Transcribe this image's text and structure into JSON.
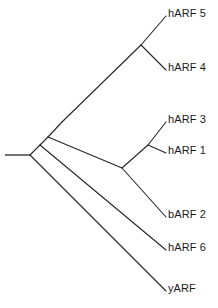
{
  "figure": {
    "type": "phylogenetic-tree",
    "orientation": "left-to-right",
    "style": "cladogram-slanted",
    "background_color": "#ffffff",
    "line_color": "#262626",
    "text_color": "#1a1a1a"
  },
  "tips": [
    {
      "id": "hARF5",
      "label": "hARF 5",
      "label_x": 168,
      "label_y": 8,
      "tip_x": 166,
      "tip_y": 16
    },
    {
      "id": "hARF4",
      "label": "hARF 4",
      "label_x": 168,
      "label_y": 62,
      "tip_x": 166,
      "tip_y": 70
    },
    {
      "id": "hARF3",
      "label": "hARF 3",
      "label_x": 168,
      "label_y": 114,
      "tip_x": 166,
      "tip_y": 122
    },
    {
      "id": "hARF1",
      "label": "hARF 1",
      "label_x": 168,
      "label_y": 145,
      "tip_x": 166,
      "tip_y": 153
    },
    {
      "id": "bARF2",
      "label": "bARF 2",
      "label_x": 168,
      "label_y": 209,
      "tip_x": 166,
      "tip_y": 217
    },
    {
      "id": "hARF6",
      "label": "hARF 6",
      "label_x": 168,
      "label_y": 242,
      "tip_x": 166,
      "tip_y": 250
    },
    {
      "id": "yARF",
      "label": "yARF",
      "label_x": 168,
      "label_y": 283,
      "tip_x": 166,
      "tip_y": 291
    }
  ],
  "nodes": [
    {
      "id": "root",
      "x": 30,
      "y": 155
    },
    {
      "id": "node-yarf",
      "x": 30,
      "y": 155
    },
    {
      "id": "node-harf6",
      "x": 40,
      "y": 145
    },
    {
      "id": "node-barf2",
      "x": 48,
      "y": 137
    },
    {
      "id": "node-upper",
      "x": 62,
      "y": 122
    },
    {
      "id": "node-54",
      "x": 141,
      "y": 45
    },
    {
      "id": "node-31",
      "x": 148,
      "y": 145
    },
    {
      "id": "node-131",
      "x": 122,
      "y": 168
    }
  ],
  "root_stub": {
    "x1": 5,
    "y1": 155,
    "x2": 30,
    "y2": 155
  },
  "branches": [
    {
      "name": "root-to-yarf",
      "x1": 30,
      "y1": 155,
      "x2": 166,
      "y2": 291
    },
    {
      "name": "root-to-node-harf6",
      "x1": 30,
      "y1": 155,
      "x2": 40,
      "y2": 145
    },
    {
      "name": "node-harf6-to-harf6",
      "x1": 40,
      "y1": 145,
      "x2": 166,
      "y2": 250
    },
    {
      "name": "node-harf6-to-barf2node",
      "x1": 40,
      "y1": 145,
      "x2": 48,
      "y2": 137
    },
    {
      "name": "node-barf2-to-crown",
      "x1": 48,
      "y1": 137,
      "x2": 122,
      "y2": 168
    },
    {
      "name": "node-barf2-to-upper",
      "x1": 48,
      "y1": 137,
      "x2": 62,
      "y2": 122
    },
    {
      "name": "crown-to-barf2",
      "x1": 122,
      "y1": 168,
      "x2": 166,
      "y2": 217
    },
    {
      "name": "crown-to-node31",
      "x1": 122,
      "y1": 168,
      "x2": 148,
      "y2": 145
    },
    {
      "name": "node31-to-harf3",
      "x1": 148,
      "y1": 145,
      "x2": 166,
      "y2": 122
    },
    {
      "name": "node31-to-harf1",
      "x1": 148,
      "y1": 145,
      "x2": 166,
      "y2": 153
    },
    {
      "name": "upper-to-node54",
      "x1": 62,
      "y1": 122,
      "x2": 141,
      "y2": 45
    },
    {
      "name": "node54-to-harf5",
      "x1": 141,
      "y1": 45,
      "x2": 166,
      "y2": 16
    },
    {
      "name": "node54-to-harf4",
      "x1": 141,
      "y1": 45,
      "x2": 166,
      "y2": 70
    }
  ]
}
